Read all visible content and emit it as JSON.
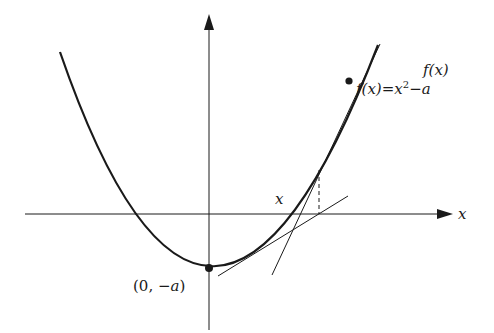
{
  "diagram": {
    "colors": {
      "ink": "#1a1a1a",
      "background": "#ffffff"
    },
    "axes": {
      "x_label": "x",
      "y_axis": "vertical axis with arrow"
    },
    "labels": {
      "function_name": "f(x)",
      "function_formula_lhs": "f(x)",
      "function_formula_eq": "=",
      "function_formula_x": "x",
      "function_formula_exp": "2",
      "function_formula_rest": "−a",
      "iterate_label": "x",
      "vertex_label_open": "(0, ",
      "vertex_label_neg": "−a",
      "vertex_label_close": ")",
      "x_axis_label": "x"
    },
    "points": [
      {
        "name": "vertex",
        "label": "(0, −a)"
      },
      {
        "name": "current-point",
        "label": "f(x) = x² − a"
      }
    ],
    "elements": [
      "parabola curve",
      "tangent line at current point",
      "tangent line at next iterate",
      "dashed vertical drop line"
    ]
  }
}
